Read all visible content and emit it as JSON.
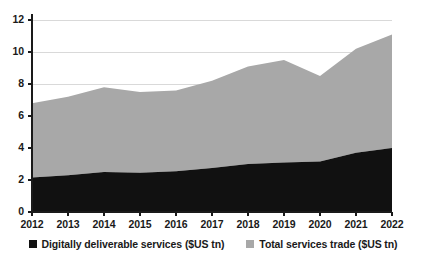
{
  "chart_data": {
    "type": "area",
    "stacked": true,
    "title": "",
    "subtitle": "",
    "xlabel": "",
    "ylabel": "",
    "x": [
      2012,
      2013,
      2014,
      2015,
      2016,
      2017,
      2018,
      2019,
      2020,
      2021,
      2022
    ],
    "categories": [
      "2012",
      "2013",
      "2014",
      "2015",
      "2016",
      "2017",
      "2018",
      "2019",
      "2020",
      "2021",
      "2022"
    ],
    "series": [
      {
        "name": "Digitally deliverable services ($US tn)",
        "color": "#111111",
        "values": [
          2.15,
          2.3,
          2.5,
          2.45,
          2.55,
          2.75,
          3.0,
          3.1,
          3.15,
          3.7,
          4.0
        ]
      },
      {
        "name": "Total services trade ($US tn)",
        "color": "#a8a8a8",
        "values": [
          6.8,
          7.2,
          7.8,
          7.5,
          7.6,
          8.2,
          9.1,
          9.5,
          8.5,
          10.2,
          11.1
        ]
      }
    ],
    "ylim": [
      0,
      12
    ],
    "xlim": [
      2012,
      2022
    ],
    "yticks": [
      0,
      2,
      4,
      6,
      8,
      10,
      12
    ],
    "ytick_labels": [
      "0",
      "2",
      "4",
      "6",
      "8",
      "10",
      "12"
    ],
    "xtick_labels": [
      "2012",
      "2013",
      "2014",
      "2015",
      "2016",
      "2017",
      "2018",
      "2019",
      "2020",
      "2021",
      "2022"
    ],
    "grid": true,
    "grid_color": "#d9d9d9",
    "axis_color": "#1a1a1a",
    "legend_position": "bottom",
    "annotations": []
  },
  "legend": {
    "items": [
      {
        "label": "Digitally deliverable services ($US tn)",
        "swatch": "dark"
      },
      {
        "label": "Total services trade ($US tn)",
        "swatch": "light"
      }
    ]
  },
  "axes": {
    "y_labels": [
      "12",
      "10",
      "8",
      "6",
      "4",
      "2",
      "0"
    ],
    "x_labels": [
      "2012",
      "2013",
      "2014",
      "2015",
      "2016",
      "2017",
      "2018",
      "2019",
      "2020",
      "2021",
      "2022"
    ]
  }
}
